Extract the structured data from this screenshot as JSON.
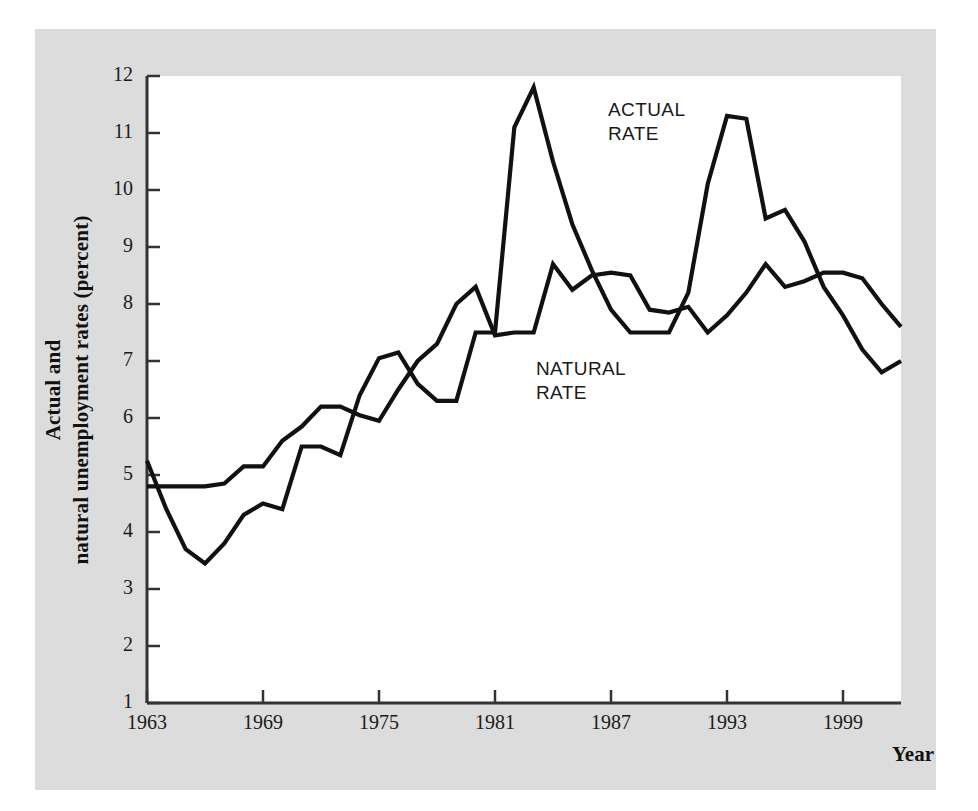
{
  "figure": {
    "panel_bg": "#dcdcdc",
    "plot_bg": "#ffffff",
    "line_color": "#111111"
  },
  "axes": {
    "y_title": "Actual and\nnatural unemployment rates (percent)",
    "y_title_line1": "Actual and",
    "y_title_line2": "natural unemployment rates (percent)",
    "x_title": "Year",
    "y_ticks": [
      "12",
      "11",
      "10",
      "9",
      "8",
      "7",
      "6",
      "5",
      "4",
      "3",
      "2",
      "1"
    ],
    "x_ticks": [
      "1963",
      "1969",
      "1975",
      "1981",
      "1987",
      "1993",
      "1999"
    ]
  },
  "labels": {
    "actual_line1": "ACTUAL",
    "actual_line2": "RATE",
    "natural_line1": "NATURAL",
    "natural_line2": "RATE"
  },
  "chart_data": {
    "type": "line",
    "title": "",
    "subtitle": "",
    "xlabel": "Year",
    "ylabel": "Actual and natural unemployment rates (percent)",
    "xlim": [
      1963,
      2002
    ],
    "ylim": [
      1,
      12
    ],
    "grid": false,
    "legend": "inline-annotations",
    "x": [
      1963,
      1964,
      1965,
      1966,
      1967,
      1968,
      1969,
      1970,
      1971,
      1972,
      1973,
      1974,
      1975,
      1976,
      1977,
      1978,
      1979,
      1980,
      1981,
      1982,
      1983,
      1984,
      1985,
      1986,
      1987,
      1988,
      1989,
      1990,
      1991,
      1992,
      1993,
      1994,
      1995,
      1996,
      1997,
      1998,
      1999,
      2000,
      2001,
      2002
    ],
    "series": [
      {
        "name": "ACTUAL RATE",
        "values": [
          5.25,
          4.4,
          3.7,
          3.45,
          3.8,
          4.3,
          4.5,
          4.4,
          5.5,
          5.5,
          5.35,
          6.4,
          7.05,
          7.15,
          6.6,
          6.3,
          6.3,
          7.5,
          7.5,
          11.1,
          11.8,
          10.5,
          9.4,
          8.6,
          7.9,
          7.5,
          7.5,
          7.5,
          8.2,
          10.1,
          11.3,
          11.25,
          9.5,
          9.65,
          9.1,
          8.3,
          7.8,
          7.2,
          6.8,
          7.0
        ]
      },
      {
        "name": "NATURAL RATE",
        "values": [
          4.8,
          4.8,
          4.8,
          4.8,
          4.85,
          5.15,
          5.15,
          5.6,
          5.85,
          6.2,
          6.2,
          6.05,
          5.95,
          6.5,
          7.0,
          7.3,
          8.0,
          8.3,
          7.45,
          7.5,
          7.5,
          8.7,
          8.25,
          8.5,
          8.55,
          8.5,
          7.9,
          7.85,
          7.95,
          7.5,
          7.8,
          8.2,
          8.7,
          8.3,
          8.4,
          8.55,
          8.55,
          8.45,
          8.0,
          7.6
        ]
      }
    ]
  }
}
